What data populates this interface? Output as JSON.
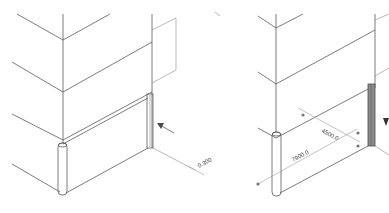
{
  "figure": {
    "panels": [
      {
        "id": "left",
        "description": "Isometric wall corner with column post and highlighted edge trim",
        "callout": {
          "type": "arrow",
          "points_to": "edge-trim"
        },
        "dimension_label": "0.300"
      },
      {
        "id": "right",
        "description": "Isometric wall corner with dimensioned panel and highlighted edge trim",
        "callout": {
          "type": "arrow-head",
          "points_to": "edge-trim"
        },
        "dimension_labels": [
          "4500.0",
          "7900.0"
        ]
      }
    ]
  },
  "colors": {
    "line": "#5a5a5a",
    "dimension_line": "#9a9a9a",
    "trim_highlight": "#6e6e6e",
    "background": "#ffffff"
  }
}
